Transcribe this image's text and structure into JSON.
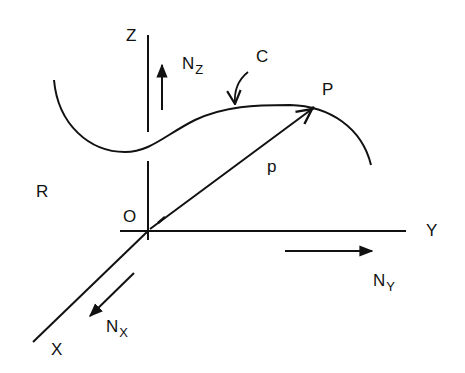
{
  "diagram": {
    "colors": {
      "stroke": "#111111",
      "background": "#ffffff"
    },
    "labels": {
      "z_axis": "Z",
      "y_axis": "Y",
      "x_axis": "X",
      "origin": "O",
      "frame": "R",
      "curve": "C",
      "point": "P",
      "vector": "p",
      "nz_main": "N",
      "nz_sub": "Z",
      "ny_main": "N",
      "ny_sub": "Y",
      "nx_main": "N",
      "nx_sub": "X"
    },
    "elements": [
      "Z axis (vertical line through O)",
      "Y axis (horizontal line through O)",
      "X axis (oblique line through O towards lower-left)",
      "Curve C (wavy space curve)",
      "Position vector p from O to P",
      "Unit direction arrows N_Z, N_Y, N_X"
    ]
  }
}
